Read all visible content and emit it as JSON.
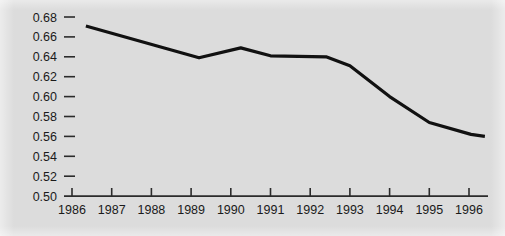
{
  "figure": {
    "background_color": "#dcdcdc",
    "line_color": "#111111",
    "axis_color": "#2b2b2b",
    "text_color": "#1a1a1a"
  },
  "chart_data": {
    "type": "line",
    "title": "",
    "subtitle": "",
    "xlabel": "",
    "ylabel": "",
    "xlim": [
      1986,
      1996
    ],
    "ylim": [
      0.5,
      0.68
    ],
    "grid": false,
    "legend": null,
    "x_tick_labels": [
      "1986",
      "1987",
      "1988",
      "1989",
      "1990",
      "1991",
      "1992",
      "1993",
      "1994",
      "1995",
      "1996"
    ],
    "x_ticks": [
      1986,
      1987,
      1988,
      1989,
      1990,
      1991,
      1992,
      1993,
      1994,
      1995,
      1996
    ],
    "y_tick_labels": [
      "0.68",
      "0.66",
      "0.64",
      "0.62",
      "0.60",
      "0.58",
      "0.56",
      "0.54",
      "0.52",
      "0.50"
    ],
    "y_ticks": [
      0.68,
      0.66,
      0.64,
      0.62,
      0.6,
      0.58,
      0.56,
      0.54,
      0.52,
      0.5
    ],
    "series": [
      {
        "name": "series-1",
        "x": [
          1986.35,
          1989.2,
          1990.25,
          1991.0,
          1992.4,
          1993.0,
          1994.0,
          1995.0,
          1996.05,
          1996.4
        ],
        "values": [
          0.671,
          0.639,
          0.649,
          0.641,
          0.64,
          0.631,
          0.6,
          0.574,
          0.562,
          0.56
        ]
      }
    ]
  }
}
